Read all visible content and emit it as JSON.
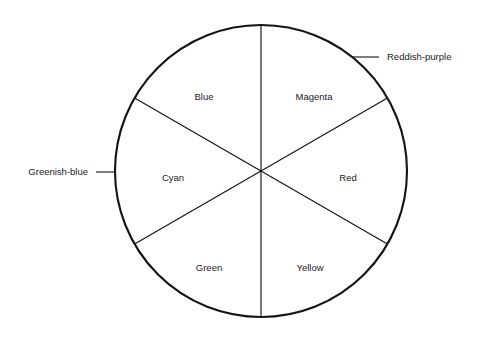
{
  "diagram": {
    "type": "color-wheel",
    "background_color": "#ffffff",
    "stroke_color": "#141414",
    "text_color": "#1a1a1a",
    "circle": {
      "center_x": 261,
      "center_y": 171,
      "radius": 146
    },
    "sectors": [
      {
        "id": "blue",
        "label": "Blue",
        "start_angle_deg": 90,
        "end_angle_deg": 150,
        "label_x": 204,
        "label_y": 97
      },
      {
        "id": "magenta",
        "label": "Magenta",
        "start_angle_deg": 30,
        "end_angle_deg": 90,
        "label_x": 314,
        "label_y": 97
      },
      {
        "id": "red",
        "label": "Red",
        "start_angle_deg": -30,
        "end_angle_deg": 30,
        "label_x": 348,
        "label_y": 178
      },
      {
        "id": "yellow",
        "label": "Yellow",
        "start_angle_deg": -90,
        "end_angle_deg": -30,
        "label_x": 310,
        "label_y": 268
      },
      {
        "id": "green",
        "label": "Green",
        "start_angle_deg": -150,
        "end_angle_deg": -90,
        "label_x": 209,
        "label_y": 268
      },
      {
        "id": "cyan",
        "label": "Cyan",
        "start_angle_deg": 150,
        "end_angle_deg": 210,
        "label_x": 173,
        "label_y": 178
      }
    ],
    "dividers": [
      {
        "id": "vertical-divider",
        "x1": 261,
        "y1": 25,
        "x2": 261,
        "y2": 317
      },
      {
        "id": "diagonal-divider-nw-se",
        "x1": 134,
        "y1": 98,
        "x2": 388,
        "y2": 244
      },
      {
        "id": "diagonal-divider-ne-sw",
        "x1": 388,
        "y1": 98,
        "x2": 134,
        "y2": 244
      }
    ],
    "callouts": [
      {
        "id": "reddish-purple",
        "label": "Reddish-purple",
        "anchor_x": 387,
        "anchor_y": 57,
        "leader_x": 379,
        "leader_y": 57,
        "line_start_x": 353,
        "line_start_y": 57,
        "side": "right"
      },
      {
        "id": "greenish-blue",
        "label": "Greenish-blue",
        "anchor_x": 88,
        "anchor_y": 172,
        "leader_x": 96,
        "leader_y": 172,
        "line_end_x": 116,
        "line_end_y": 172,
        "side": "left"
      }
    ]
  }
}
